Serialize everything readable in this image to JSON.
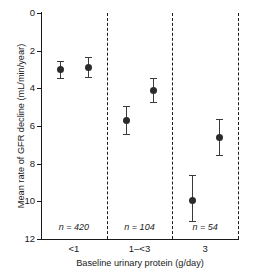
{
  "chart_data": {
    "type": "scatter",
    "title": "",
    "xlabel": "Baseline urinary protein (g/day)",
    "ylabel": "Mean rate of GFR decline (mL/min/year)",
    "ylim": [
      0,
      12
    ],
    "y_inverted": true,
    "yticks": [
      0,
      2,
      4,
      6,
      8,
      10,
      12
    ],
    "ytick_labels": [
      "0",
      "2",
      "4",
      "6",
      "8",
      "10",
      "12"
    ],
    "categories": [
      "<1",
      "1–<3",
      "3"
    ],
    "grid": false,
    "legend": "none",
    "group_annotations": [
      "n = 420",
      "n = 104",
      "n = 54"
    ],
    "group_counts": [
      420,
      104,
      54
    ],
    "separators_dashed": true,
    "points": [
      {
        "group": "<1",
        "x": 0.3,
        "y": 3.0,
        "y_low": 3.45,
        "y_high": 2.55
      },
      {
        "group": "<1",
        "x": 0.72,
        "y": 2.88,
        "y_low": 3.4,
        "y_high": 2.35
      },
      {
        "group": "1–<3",
        "x": 1.3,
        "y": 5.72,
        "y_low": 6.4,
        "y_high": 4.95
      },
      {
        "group": "1–<3",
        "x": 1.72,
        "y": 4.12,
        "y_low": 4.75,
        "y_high": 3.45
      },
      {
        "group": "3",
        "x": 2.3,
        "y": 9.98,
        "y_low": 11.05,
        "y_high": 8.6
      },
      {
        "group": "3",
        "x": 2.72,
        "y": 6.6,
        "y_low": 7.55,
        "y_high": 5.65
      }
    ],
    "colors": {
      "marker": "#2b2b2b",
      "errorbar": "#3a3a3a",
      "axis": "#1a1a1a",
      "background": "#ffffff"
    }
  }
}
